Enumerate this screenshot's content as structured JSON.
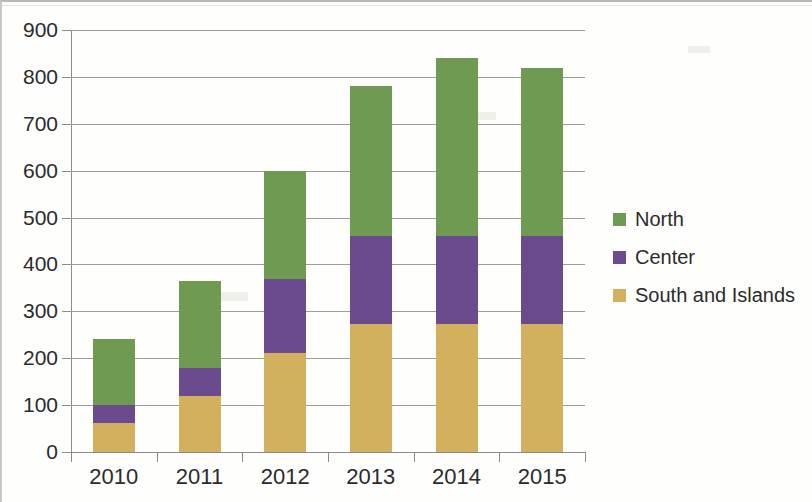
{
  "chart_data": {
    "type": "bar",
    "stacked": true,
    "title": "",
    "xlabel": "",
    "ylabel": "",
    "categories": [
      "2010",
      "2011",
      "2012",
      "2013",
      "2014",
      "2015"
    ],
    "series": [
      {
        "name": "South and Islands",
        "color": "#d3b05e",
        "values": [
          62,
          120,
          212,
          272,
          272,
          272
        ]
      },
      {
        "name": "Center",
        "color": "#6b4a8e",
        "values": [
          38,
          60,
          158,
          188,
          188,
          188
        ]
      },
      {
        "name": "North",
        "color": "#6e9a51",
        "values": [
          140,
          185,
          230,
          320,
          380,
          360
        ]
      }
    ],
    "stack_totals": [
      240,
      365,
      600,
      780,
      840,
      820
    ],
    "ylim": [
      0,
      900
    ],
    "ytick_step": 100,
    "ytick_labels": [
      "900",
      "800",
      "700",
      "600",
      "500",
      "400",
      "300",
      "200",
      "100",
      "0"
    ],
    "grid": true,
    "grid_axis": "y",
    "legend_position": "right",
    "legend_order": [
      "North",
      "Center",
      "South and Islands"
    ]
  },
  "axis": {
    "y_labels": [
      "900",
      "800",
      "700",
      "600",
      "500",
      "400",
      "300",
      "200",
      "100",
      "0"
    ],
    "x_labels": [
      "2010",
      "2011",
      "2012",
      "2013",
      "2014",
      "2015"
    ]
  },
  "legend": {
    "items": [
      {
        "label": "North",
        "color": "#6e9a51"
      },
      {
        "label": "Center",
        "color": "#6b4a8e"
      },
      {
        "label": "South and Islands",
        "color": "#d3b05e"
      }
    ]
  },
  "colors": {
    "north": "#6e9a51",
    "center": "#6b4a8e",
    "south_and_islands": "#d3b05e",
    "gridline": "#9d9d98",
    "axis": "#8d8d88",
    "text": "#2b2b2b",
    "background": "#fefefd"
  }
}
